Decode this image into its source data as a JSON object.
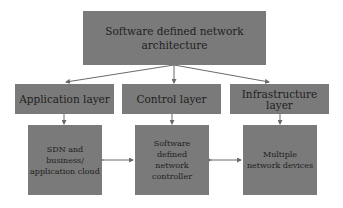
{
  "diagram": {
    "root": {
      "label": "Software defined network architecture"
    },
    "layers": [
      {
        "label": "Application layer"
      },
      {
        "label": "Control layer"
      },
      {
        "label": "Infrastructure layer"
      }
    ],
    "components": [
      {
        "label": "SDN and business/ application cloud"
      },
      {
        "label": "Software defined network controller"
      },
      {
        "label": "Multiple network devices"
      }
    ],
    "edges": [
      {
        "from": "root",
        "to": "Application layer",
        "type": "arrow"
      },
      {
        "from": "root",
        "to": "Control layer",
        "type": "arrow"
      },
      {
        "from": "root",
        "to": "Infrastructure layer",
        "type": "arrow"
      },
      {
        "from": "Application layer",
        "to": "SDN and business/ application cloud",
        "type": "arrow"
      },
      {
        "from": "Control layer",
        "to": "Software defined network controller",
        "type": "arrow"
      },
      {
        "from": "Infrastructure layer",
        "to": "Multiple network devices",
        "type": "arrow"
      },
      {
        "from": "SDN and business/ application cloud",
        "to": "Software defined network controller",
        "type": "bidirectional"
      },
      {
        "from": "Software defined network controller",
        "to": "Multiple network devices",
        "type": "bidirectional"
      }
    ],
    "colors": {
      "box_fill": "#7a7a7a",
      "text": "#1e1e1e",
      "arrow": "#6a6a6a"
    }
  }
}
